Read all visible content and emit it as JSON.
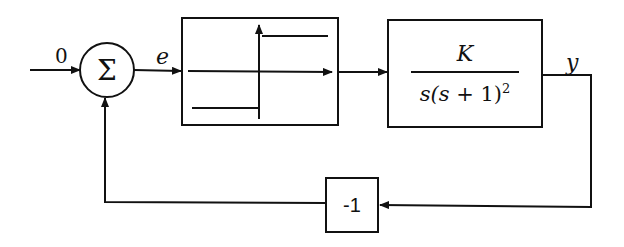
{
  "diagram": {
    "type": "feedback block diagram",
    "input_label": "0",
    "sum_symbol": "Σ",
    "error_label": "e",
    "nonlinearity": {
      "name": "relay",
      "description": "ideal relay / sign function"
    },
    "plant": {
      "numerator": "K",
      "denominator_prefix": "s(",
      "denominator_var": "s",
      "denominator_mid": " + 1)",
      "denominator_exp": "2"
    },
    "output_label": "y",
    "feedback_gain": "-1"
  }
}
